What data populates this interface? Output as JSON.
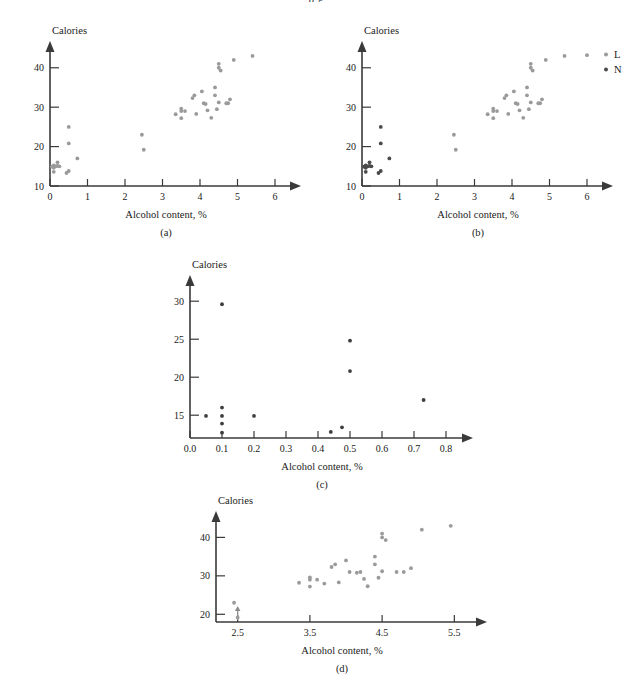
{
  "figure": {
    "top_partial_text": "p g",
    "panels": [
      "a",
      "b",
      "c",
      "d"
    ]
  },
  "panel_a": {
    "caption": "(a)",
    "xlabel": "Alcohol content, %",
    "ylabel": "Calories"
  },
  "panel_b": {
    "caption": "(b)",
    "xlabel": "Alcohol content, %",
    "ylabel": "Calories",
    "legend": [
      {
        "key": "L",
        "label": "L",
        "color": "#9a9a9a"
      },
      {
        "key": "N",
        "label": "N",
        "color": "#4a4a4a"
      }
    ]
  },
  "panel_c": {
    "caption": "(c)",
    "xlabel": "Alcohol content, %",
    "ylabel": "Calories"
  },
  "panel_d": {
    "caption": "(d)",
    "xlabel": "Alcohol content, %",
    "ylabel": "Calories"
  },
  "chart_data": [
    {
      "id": "a",
      "type": "scatter",
      "title": "",
      "subtitle": "(a)",
      "xlabel": "Alcohol content, %",
      "ylabel": "Calories",
      "xlim": [
        0,
        6.4
      ],
      "ylim": [
        10,
        44
      ],
      "xticks": [
        0,
        1,
        2,
        3,
        4,
        5,
        6
      ],
      "xticklabels": [
        "0",
        "1",
        "2",
        "3",
        "4",
        "5",
        "6"
      ],
      "yticks": [
        10,
        20,
        30,
        40
      ],
      "yticklabels": [
        "10",
        "20",
        "30",
        "40"
      ],
      "grid": false,
      "legend": null,
      "marker_color": "#9a9a9a",
      "series": [
        {
          "name": "All beers",
          "color": "#9a9a9a",
          "points": [
            [
              0.1,
              15.2
            ],
            [
              0.1,
              14.6
            ],
            [
              0.1,
              13.6
            ],
            [
              0.15,
              15.0
            ],
            [
              0.2,
              15.1
            ],
            [
              0.2,
              16.0
            ],
            [
              0.25,
              15.0
            ],
            [
              0.05,
              14.9
            ],
            [
              0.44,
              13.3
            ],
            [
              0.5,
              13.8
            ],
            [
              0.5,
              25.0
            ],
            [
              0.5,
              20.8
            ],
            [
              0.73,
              17.0
            ],
            [
              2.45,
              23.0
            ],
            [
              2.5,
              19.2
            ],
            [
              3.35,
              28.2
            ],
            [
              3.5,
              29.6
            ],
            [
              3.5,
              29.0
            ],
            [
              3.5,
              27.2
            ],
            [
              3.6,
              29.0
            ],
            [
              3.8,
              32.3
            ],
            [
              3.85,
              33.0
            ],
            [
              3.9,
              28.3
            ],
            [
              4.05,
              34.0
            ],
            [
              4.1,
              31.0
            ],
            [
              4.15,
              30.8
            ],
            [
              4.2,
              29.2
            ],
            [
              4.3,
              27.3
            ],
            [
              4.4,
              35.0
            ],
            [
              4.4,
              33.0
            ],
            [
              4.45,
              29.5
            ],
            [
              4.5,
              31.2
            ],
            [
              4.5,
              41.0
            ],
            [
              4.5,
              40.0
            ],
            [
              4.55,
              39.3
            ],
            [
              4.7,
              31.0
            ],
            [
              4.75,
              31.0
            ],
            [
              4.8,
              32.0
            ],
            [
              4.9,
              42.0
            ],
            [
              5.4,
              43.0
            ]
          ]
        }
      ]
    },
    {
      "id": "b",
      "type": "scatter",
      "title": "",
      "subtitle": "(b)",
      "xlabel": "Alcohol content, %",
      "ylabel": "Calories",
      "xlim": [
        0,
        6.4
      ],
      "ylim": [
        10,
        44
      ],
      "xticks": [
        0,
        1,
        2,
        3,
        4,
        5,
        6
      ],
      "xticklabels": [
        "0",
        "1",
        "2",
        "3",
        "4",
        "5",
        "6"
      ],
      "yticks": [
        10,
        20,
        30,
        40
      ],
      "yticklabels": [
        "10",
        "20",
        "30",
        "40"
      ],
      "grid": false,
      "legend": {
        "position": "top-right",
        "entries": [
          "L",
          "N"
        ]
      },
      "series": [
        {
          "name": "L",
          "color": "#9a9a9a",
          "points": [
            [
              2.45,
              23.0
            ],
            [
              2.5,
              19.2
            ],
            [
              3.35,
              28.2
            ],
            [
              3.5,
              29.6
            ],
            [
              3.5,
              29.0
            ],
            [
              3.5,
              27.2
            ],
            [
              3.6,
              29.0
            ],
            [
              3.8,
              32.3
            ],
            [
              3.85,
              33.0
            ],
            [
              3.9,
              28.3
            ],
            [
              4.05,
              34.0
            ],
            [
              4.1,
              31.0
            ],
            [
              4.15,
              30.8
            ],
            [
              4.2,
              29.2
            ],
            [
              4.3,
              27.3
            ],
            [
              4.4,
              35.0
            ],
            [
              4.4,
              33.0
            ],
            [
              4.45,
              29.5
            ],
            [
              4.5,
              31.2
            ],
            [
              4.5,
              41.0
            ],
            [
              4.5,
              40.0
            ],
            [
              4.55,
              39.3
            ],
            [
              4.7,
              31.0
            ],
            [
              4.75,
              31.0
            ],
            [
              4.8,
              32.0
            ],
            [
              4.9,
              42.0
            ],
            [
              5.4,
              43.0
            ],
            [
              6.0,
              43.2
            ]
          ]
        },
        {
          "name": "N",
          "color": "#4a4a4a",
          "points": [
            [
              0.1,
              15.2
            ],
            [
              0.1,
              14.6
            ],
            [
              0.1,
              13.6
            ],
            [
              0.15,
              15.0
            ],
            [
              0.2,
              15.1
            ],
            [
              0.2,
              16.0
            ],
            [
              0.25,
              15.0
            ],
            [
              0.05,
              14.9
            ],
            [
              0.44,
              13.3
            ],
            [
              0.5,
              13.8
            ],
            [
              0.5,
              25.0
            ],
            [
              0.5,
              20.8
            ],
            [
              0.73,
              17.0
            ]
          ]
        }
      ]
    },
    {
      "id": "c",
      "type": "scatter",
      "title": "",
      "subtitle": "(c)",
      "xlabel": "Alcohol content, %",
      "ylabel": "Calories",
      "xlim": [
        0.0,
        0.85
      ],
      "ylim": [
        12,
        32
      ],
      "xticks": [
        0.0,
        0.1,
        0.2,
        0.3,
        0.4,
        0.5,
        0.6,
        0.7,
        0.8
      ],
      "xticklabels": [
        "0.0",
        "0.1",
        "0.2",
        "0.3",
        "0.4",
        "0.5",
        "0.6",
        "0.7",
        "0.8"
      ],
      "yticks": [
        15,
        20,
        25,
        30
      ],
      "yticklabels": [
        "15",
        "20",
        "25",
        "30"
      ],
      "grid": false,
      "legend": null,
      "series": [
        {
          "name": "Non-alcoholic beers",
          "color": "#3d3d3d",
          "points": [
            [
              0.05,
              14.9
            ],
            [
              0.1,
              29.6
            ],
            [
              0.1,
              16.0
            ],
            [
              0.1,
              14.9
            ],
            [
              0.1,
              13.9
            ],
            [
              0.1,
              12.7
            ],
            [
              0.2,
              14.9
            ],
            [
              0.44,
              12.8
            ],
            [
              0.475,
              13.4
            ],
            [
              0.5,
              24.8
            ],
            [
              0.5,
              20.8
            ],
            [
              0.73,
              17.0
            ]
          ]
        }
      ]
    },
    {
      "id": "d",
      "type": "scatter",
      "title": "",
      "subtitle": "(d)",
      "xlabel": "Alcohol content, %",
      "ylabel": "Calories",
      "xlim": [
        2.2,
        5.8
      ],
      "ylim": [
        18,
        44
      ],
      "xticks": [
        2.5,
        3.5,
        4.5,
        5.5
      ],
      "xticklabels": [
        "2.5",
        "3.5",
        "4.5",
        "5.5"
      ],
      "yticks": [
        20,
        30,
        40
      ],
      "yticklabels": [
        "20",
        "30",
        "40"
      ],
      "grid": false,
      "legend": null,
      "series": [
        {
          "name": "Alcoholic beers",
          "color": "#9a9a9a",
          "points": [
            [
              2.45,
              23.0
            ],
            [
              2.5,
              19.2
            ],
            [
              3.35,
              28.2
            ],
            [
              3.5,
              29.6
            ],
            [
              3.5,
              29.0
            ],
            [
              3.5,
              27.2
            ],
            [
              3.6,
              29.0
            ],
            [
              3.7,
              28.0
            ],
            [
              3.8,
              32.3
            ],
            [
              3.85,
              33.0
            ],
            [
              3.9,
              28.3
            ],
            [
              4.0,
              34.0
            ],
            [
              4.05,
              31.0
            ],
            [
              4.15,
              30.8
            ],
            [
              4.2,
              31.0
            ],
            [
              4.25,
              29.2
            ],
            [
              4.3,
              27.3
            ],
            [
              4.4,
              35.0
            ],
            [
              4.4,
              33.0
            ],
            [
              4.45,
              29.5
            ],
            [
              4.5,
              31.2
            ],
            [
              4.5,
              41.0
            ],
            [
              4.5,
              40.0
            ],
            [
              4.55,
              39.3
            ],
            [
              4.7,
              31.0
            ],
            [
              4.8,
              31.0
            ],
            [
              4.9,
              32.0
            ],
            [
              5.05,
              42.0
            ],
            [
              5.45,
              43.0
            ]
          ]
        }
      ]
    }
  ]
}
